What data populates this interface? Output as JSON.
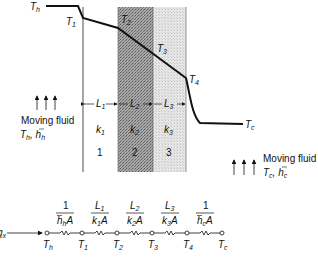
{
  "diagram": {
    "temperature_profile": {
      "hot_label": "T_h",
      "cold_label": "T_c",
      "interface_labels": [
        "T_1",
        "T_2",
        "T_3",
        "T_4"
      ]
    },
    "layers": [
      {
        "length": "L1",
        "conductivity": "k1",
        "number": "1",
        "shade": "#ffffff"
      },
      {
        "length": "L2",
        "conductivity": "k2",
        "number": "2",
        "shade": "#9a9a9a"
      },
      {
        "length": "L3",
        "conductivity": "k3",
        "number": "3",
        "shade": "#dcdcdc"
      }
    ],
    "hot_fluid": {
      "title": "Moving fluid",
      "props": "T_h, h̄_h"
    },
    "cold_fluid": {
      "title": "Moving fluid",
      "props": "T_c, h̄_c"
    },
    "circuit": {
      "flow_label": "q_x",
      "resistances": [
        "1/(h̄_h A)",
        "L1/(k1 A)",
        "L2/(k2 A)",
        "L3/(k3 A)",
        "1/(h̄_c A)"
      ],
      "nodes": [
        "T_h",
        "T_1",
        "T_2",
        "T_3",
        "T_4",
        "T_c"
      ]
    }
  },
  "text": {
    "hot_fluid_title": "Moving fluid",
    "cold_fluid_title": "Moving fluid",
    "n1": "1",
    "n2": "2",
    "n3": "3"
  }
}
